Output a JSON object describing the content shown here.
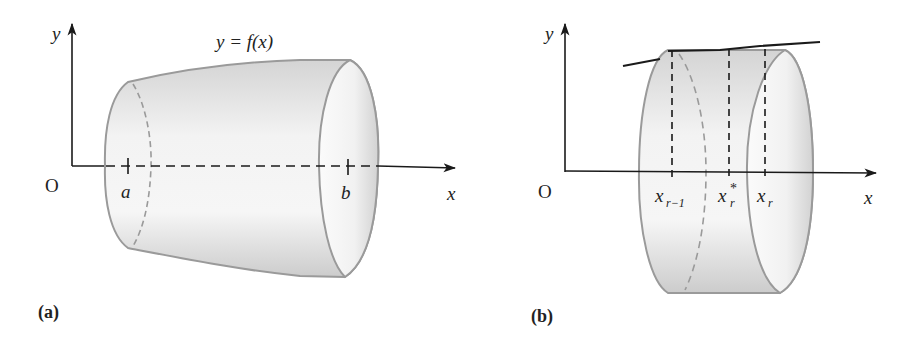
{
  "figure": {
    "panels": [
      {
        "id": "a",
        "caption": "(a)",
        "origin_label": "O",
        "x_axis_label": "x",
        "y_axis_label": "y",
        "curve_label": "y = f(x)",
        "tick_labels": [
          "a",
          "b"
        ],
        "description": "Solid of revolution formed by rotating y = f(x) about the x-axis between x = a and x = b"
      },
      {
        "id": "b",
        "caption": "(b)",
        "origin_label": "O",
        "x_axis_label": "x",
        "y_axis_label": "y",
        "tick_labels": [
          {
            "base": "x",
            "sub": "r−1",
            "sup": ""
          },
          {
            "base": "x",
            "sub": "r",
            "sup": "*"
          },
          {
            "base": "x",
            "sub": "r",
            "sup": ""
          }
        ],
        "description": "Thin cylindrical disc slice between x_{r-1} and x_r with sample point x_r*"
      }
    ],
    "colors": {
      "outline": "#9a9a9a",
      "axis": "#1a1a1a",
      "fill_light": "#f4f4f4",
      "fill_dark": "#cfcfcf",
      "curve": "#1a1a1a"
    }
  }
}
